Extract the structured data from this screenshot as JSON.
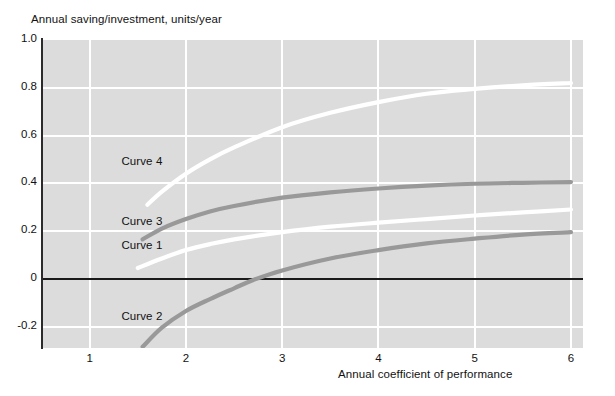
{
  "chart_data": {
    "type": "line",
    "title": "",
    "ylabel": "Annual saving/investment, units/year",
    "xlabel": "Annual coefficient of performance",
    "xlim": [
      0.515,
      6.125
    ],
    "ylim": [
      -0.29,
      1.0
    ],
    "grid": true,
    "legend": "inline-labels",
    "xticks": [
      "1",
      "2",
      "3",
      "4",
      "5",
      "6"
    ],
    "xtick_values": [
      1,
      2,
      3,
      4,
      5,
      6
    ],
    "yticks": [
      "1.0",
      "0.8",
      "0.6",
      "0.4",
      "0.2",
      "0",
      "-0.2"
    ],
    "ytick_values": [
      1.0,
      0.8,
      0.6,
      0.4,
      0.2,
      0,
      -0.2
    ],
    "zero_line": 0,
    "series": [
      {
        "name": "Curve 1",
        "color": "#ffffff",
        "label_x": 1.33,
        "label_y": 0.135,
        "x": [
          1.5,
          1.75,
          2.0,
          2.25,
          2.5,
          3.0,
          3.5,
          4.0,
          4.5,
          5.0,
          5.5,
          6.0
        ],
        "y": [
          0.045,
          0.085,
          0.12,
          0.145,
          0.165,
          0.195,
          0.218,
          0.235,
          0.25,
          0.265,
          0.278,
          0.29
        ]
      },
      {
        "name": "Curve 2",
        "color": "#999999",
        "label_x": 1.33,
        "label_y": -0.165,
        "x": [
          1.55,
          1.75,
          2.0,
          2.25,
          2.5,
          2.7,
          3.0,
          3.5,
          4.0,
          4.5,
          5.0,
          5.5,
          6.0
        ],
        "y": [
          -0.285,
          -0.205,
          -0.135,
          -0.085,
          -0.04,
          -0.005,
          0.035,
          0.085,
          0.12,
          0.148,
          0.168,
          0.185,
          0.195
        ]
      },
      {
        "name": "Curve 3",
        "color": "#999999",
        "label_x": 1.33,
        "label_y": 0.235,
        "x": [
          1.55,
          1.75,
          2.0,
          2.25,
          2.5,
          3.0,
          3.5,
          4.0,
          4.5,
          5.0,
          5.5,
          6.0
        ],
        "y": [
          0.165,
          0.21,
          0.25,
          0.282,
          0.305,
          0.34,
          0.362,
          0.378,
          0.39,
          0.398,
          0.402,
          0.405
        ]
      },
      {
        "name": "Curve 4",
        "color": "#ffffff",
        "label_x": 1.33,
        "label_y": 0.485,
        "x": [
          1.6,
          1.75,
          2.0,
          2.25,
          2.5,
          3.0,
          3.5,
          4.0,
          4.5,
          5.0,
          5.5,
          6.0
        ],
        "y": [
          0.31,
          0.365,
          0.44,
          0.5,
          0.55,
          0.635,
          0.695,
          0.74,
          0.775,
          0.795,
          0.81,
          0.82
        ]
      }
    ],
    "colors": {
      "plot_background": "#dcdcdc",
      "gridline": "#ffffff",
      "axis": "#2b2b2b",
      "zero_line": "#1a1a1a",
      "page_background": "#ffffff",
      "text": "#111111"
    }
  }
}
